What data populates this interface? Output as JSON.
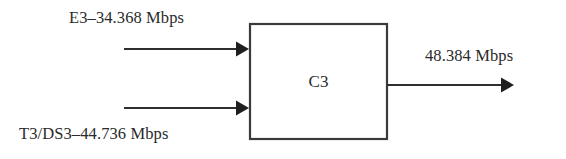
{
  "diagram": {
    "node": {
      "label": "C3",
      "shape": "rectangle"
    },
    "inputs": [
      {
        "label": "E3–34.368 Mbps",
        "signal": "E3",
        "rate_mbps": 34.368
      },
      {
        "label": "T3/DS3–44.736 Mbps",
        "signal": "T3/DS3",
        "rate_mbps": 44.736
      }
    ],
    "outputs": [
      {
        "label": "48.384 Mbps",
        "rate_mbps": 48.384
      }
    ],
    "colors": {
      "background": "#ffffff",
      "stroke": "#3a3a3a",
      "text": "#2b2b2b"
    }
  }
}
